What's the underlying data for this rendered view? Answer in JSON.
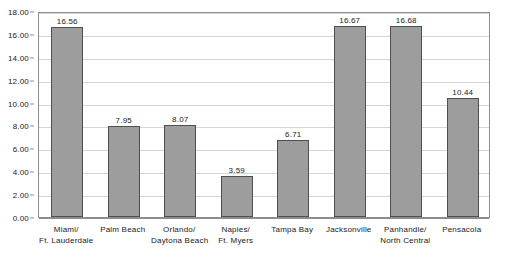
{
  "chart_data": {
    "type": "bar",
    "title": "",
    "xlabel": "",
    "ylabel": "",
    "ylim": [
      0,
      18
    ],
    "ytick_step": 2,
    "grid": true,
    "legend": "none",
    "value_label_format": "2 decimals",
    "categories": [
      "Miami/\nFt. Lauderdale",
      "Palm Beach",
      "Orlando/\nDaytona Beach",
      "Naples/\nFt. Myers",
      "Tampa Bay",
      "Jacksonville",
      "Panhandle/\nNorth Central",
      "Pensacola"
    ],
    "category_lines": [
      [
        "Miami/",
        "Ft. Lauderdale"
      ],
      [
        "Palm Beach"
      ],
      [
        "Orlando/",
        "Daytona Beach"
      ],
      [
        "Naples/",
        "Ft. Myers"
      ],
      [
        "Tampa Bay"
      ],
      [
        "Jacksonville"
      ],
      [
        "Panhandle/",
        "North Central"
      ],
      [
        "Pensacola"
      ]
    ],
    "values": [
      16.56,
      7.95,
      8.07,
      3.59,
      6.71,
      16.67,
      16.68,
      10.44
    ],
    "value_labels": [
      "16.56",
      "7.95",
      "8.07",
      "3.59",
      "6.71",
      "16.67",
      "16.68",
      "10.44"
    ],
    "ytick_labels": [
      "0.00",
      "2.00",
      "4.00",
      "6.00",
      "8.00",
      "10.00",
      "12.00",
      "14.00",
      "16.00",
      "18.00"
    ],
    "ytick_values": [
      0,
      2,
      4,
      6,
      8,
      10,
      12,
      14,
      16,
      18
    ],
    "colors": {
      "bar_fill": "#9d9d9d",
      "bar_border": "#4f4f4f",
      "gridline": "#d6d6d6",
      "axis": "#8d8d8d",
      "text": "#1a1a1a",
      "background": "#ffffff"
    }
  }
}
